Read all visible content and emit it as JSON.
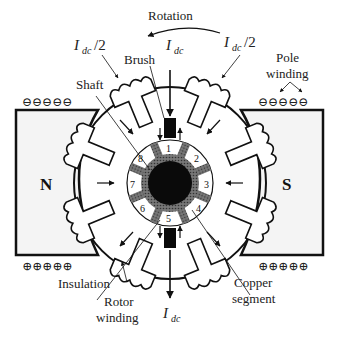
{
  "labels": {
    "rotation": "Rotation",
    "idc_half_left_main": "I",
    "idc_half_left_sub": "dc",
    "idc_half_left_tail": "/2",
    "idc_top_main": "I",
    "idc_top_sub": "dc",
    "idc_half_right_main": "I",
    "idc_half_right_sub": "dc",
    "idc_half_right_tail": "/2",
    "brush": "Brush",
    "pole_winding_line1": "Pole",
    "pole_winding_line2": "winding",
    "shaft": "Shaft",
    "north": "N",
    "south": "S",
    "insulation": "Insulation",
    "rotor_winding_line1": "Rotor",
    "rotor_winding_line2": "winding",
    "copper_segment_line1": "Copper",
    "copper_segment_line2": "segment",
    "idc_bottom_main": "I",
    "idc_bottom_sub": "dc"
  },
  "commutator_segments": [
    "1",
    "2",
    "3",
    "4",
    "5",
    "6",
    "7",
    "8"
  ],
  "pole_charges": {
    "top": "⊖⊖⊖⊖⊖",
    "bottom": "⊕⊕⊕⊕⊕"
  },
  "colors": {
    "line": "#111111",
    "insulation": "#555555",
    "pole_fill": "#f4f4f4"
  }
}
